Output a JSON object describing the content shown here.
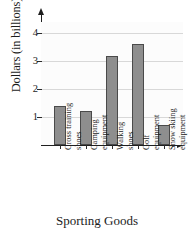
{
  "chart_data": {
    "type": "bar",
    "title": "",
    "xlabel": "Sporting Goods",
    "ylabel": "Dollars (in billions)",
    "categories": [
      "Cross training shoes",
      "Camping equipment",
      "Walking shoes",
      "Golf equipment",
      "Snow skiing equipment"
    ],
    "category_lines": [
      [
        "Cross training",
        "shoes"
      ],
      [
        "Camping",
        "equipment"
      ],
      [
        "Walking",
        "shoes"
      ],
      [
        "Golf",
        "equipment"
      ],
      [
        "Snow skiing",
        "equipment"
      ]
    ],
    "values": [
      1.4,
      1.2,
      3.2,
      3.6,
      0.7
    ],
    "ylim": [
      0,
      4.4
    ],
    "yticks": [
      1,
      2,
      3,
      4
    ],
    "ytick_labels": [
      "1",
      "2",
      "3",
      "4"
    ],
    "grid": true,
    "legend": false,
    "bar_color": "#8e8e8e",
    "bar_border_color": "#4a4a4a",
    "axis_color": "#1f1f1f",
    "grid_color": "#d8d8d8",
    "plot_background": "#fcfcfc"
  }
}
